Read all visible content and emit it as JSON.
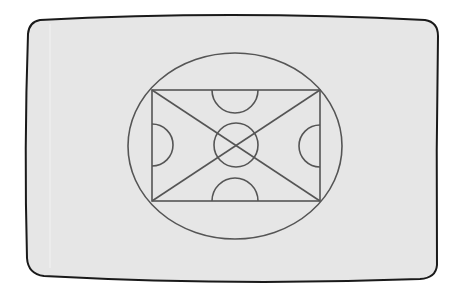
{
  "screen": {
    "background_color": "#e6e6e6",
    "frame_color": "#1a1a1a",
    "page_color": "#ffffff"
  },
  "drawing": {
    "stroke_color": "#555555",
    "shapes": {
      "outer_ellipse": {
        "cx": 235,
        "cy": 146,
        "rx": 107,
        "ry": 93
      },
      "field_rect": {
        "x": 152,
        "y": 90,
        "width": 168,
        "height": 111
      },
      "diagonals": [
        {
          "x1": 152,
          "y1": 90,
          "x2": 320,
          "y2": 201
        },
        {
          "x1": 320,
          "y1": 90,
          "x2": 152,
          "y2": 201
        }
      ],
      "center_circle": {
        "cx": 236,
        "cy": 145,
        "r": 22
      },
      "arcs": [
        {
          "name": "top-semicircle",
          "cx": 235,
          "cy": 90,
          "r": 23,
          "side": "down"
        },
        {
          "name": "bottom-semicircle",
          "cx": 235,
          "cy": 201,
          "r": 23,
          "side": "up"
        },
        {
          "name": "left-semicircle",
          "cx": 152,
          "cy": 145,
          "r": 21,
          "side": "right"
        },
        {
          "name": "right-semicircle",
          "cx": 320,
          "cy": 146,
          "r": 21,
          "side": "left"
        }
      ]
    }
  }
}
